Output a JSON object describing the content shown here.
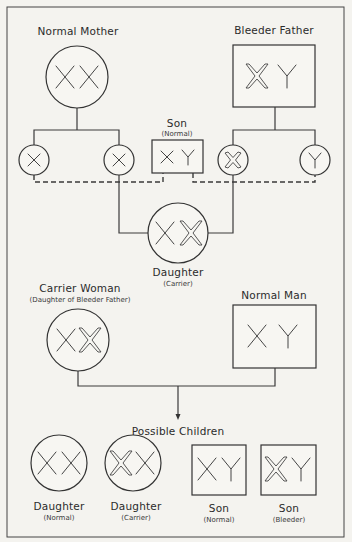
{
  "generation1": {
    "mother": {
      "label": "Normal Mother",
      "chromosomes": [
        "X",
        "X"
      ],
      "affected_x": []
    },
    "father": {
      "label": "Bleeder Father",
      "chromosomes": [
        "X",
        "Y"
      ],
      "affected_x": [
        0
      ]
    },
    "gametes": [
      {
        "parent": "mother",
        "chromosome": "X",
        "affected": false
      },
      {
        "parent": "mother",
        "chromosome": "X",
        "affected": false
      },
      {
        "parent": "father",
        "chromosome": "X",
        "affected": true
      },
      {
        "parent": "father",
        "chromosome": "Y",
        "affected": false
      }
    ],
    "son": {
      "label": "Son",
      "sublabel": "(Normal)",
      "chromosomes": [
        "X",
        "Y"
      ]
    },
    "daughter": {
      "label": "Daughter",
      "sublabel": "(Carrier)",
      "chromosomes": [
        "X",
        "X"
      ],
      "affected_x": [
        1
      ]
    }
  },
  "generation2": {
    "woman": {
      "label": "Carrier Woman",
      "sublabel": "(Daughter of Bleeder Father)",
      "chromosomes": [
        "X",
        "X"
      ],
      "affected_x": [
        1
      ]
    },
    "man": {
      "label": "Normal Man",
      "chromosomes": [
        "X",
        "Y"
      ],
      "affected_x": []
    },
    "children_heading": "Possible Children",
    "children": [
      {
        "label": "Daughter",
        "sublabel": "(Normal)",
        "shape": "circle",
        "chromosomes": [
          "X",
          "X"
        ],
        "affected_x": []
      },
      {
        "label": "Daughter",
        "sublabel": "(Carrier)",
        "shape": "circle",
        "chromosomes": [
          "X",
          "X"
        ],
        "affected_x": [
          0
        ]
      },
      {
        "label": "Son",
        "sublabel": "(Normal)",
        "shape": "square",
        "chromosomes": [
          "X",
          "Y"
        ],
        "affected_x": []
      },
      {
        "label": "Son",
        "sublabel": "(Bleeder)",
        "shape": "square",
        "chromosomes": [
          "X",
          "Y"
        ],
        "affected_x": [
          0
        ]
      }
    ]
  },
  "legend": {
    "circle": "female",
    "square": "male",
    "outlined_x": "X chromosome carrying bleeder gene",
    "plain_x": "normal X chromosome",
    "dashed_line": "gamete combination",
    "solid_line": "descent"
  }
}
